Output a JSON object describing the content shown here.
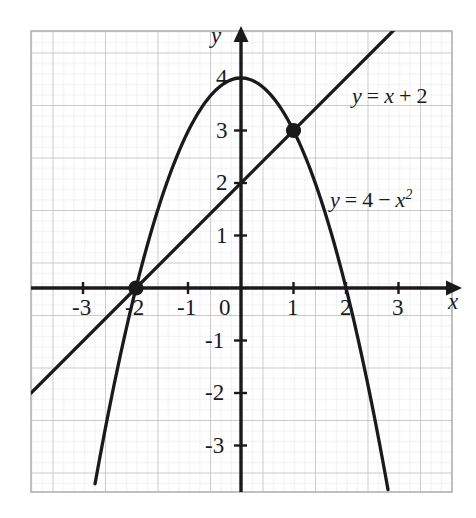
{
  "figure": {
    "kind": "cartesian-graph",
    "background": "#ffffff",
    "grid": {
      "minor_color": "#e3e3ea",
      "major_color": "#b9b9c0",
      "border_color": "#b0b0b8",
      "minor_step_units": 0.2,
      "major_step_units": 1
    },
    "axis_color": "#1a1a1a",
    "curve_color": "#1a1a1a",
    "point_color": "#1a1a1a"
  },
  "axes": {
    "x_name": "x",
    "y_name": "y",
    "x_ticks": [
      {
        "value": -3,
        "label": "-3"
      },
      {
        "value": -2,
        "label": "-2"
      },
      {
        "value": -1,
        "label": "-1"
      },
      {
        "value": 1,
        "label": "1"
      },
      {
        "value": 2,
        "label": "2"
      },
      {
        "value": 3,
        "label": "3"
      }
    ],
    "origin_label": "0",
    "y_ticks": [
      {
        "value": 4,
        "label": "4"
      },
      {
        "value": 3,
        "label": "3"
      },
      {
        "value": 2,
        "label": "2"
      },
      {
        "value": 1,
        "label": "1"
      },
      {
        "value": -1,
        "label": "-1"
      },
      {
        "value": -2,
        "label": "-2"
      },
      {
        "value": -3,
        "label": "-3"
      }
    ]
  },
  "labels": {
    "line_eq_y": "y",
    "line_eq_eq": "=",
    "line_eq_rhs_var": "x",
    "line_eq_plus": "+",
    "line_eq_const": "2",
    "parab_eq_y": "y",
    "parab_eq_eq": "=",
    "parab_eq_four": "4",
    "parab_eq_minus": "−",
    "parab_eq_var": "x",
    "parab_eq_exp": "2"
  },
  "chart_data": {
    "type": "line",
    "title": "",
    "xlabel": "x",
    "ylabel": "y",
    "xlim": [
      -4,
      4
    ],
    "ylim": [
      -3.9,
      4.9
    ],
    "grid": true,
    "legend": "inline-annotations",
    "series": [
      {
        "name": "y = x + 2",
        "equation": "y = x + 2",
        "kind": "straight-line",
        "slope": 1,
        "intercept": 2,
        "x_range": [
          -4,
          3.03
        ],
        "points": [
          {
            "x": -4,
            "y": -2
          },
          {
            "x": -2,
            "y": 0
          },
          {
            "x": 0,
            "y": 2
          },
          {
            "x": 1,
            "y": 3
          },
          {
            "x": 3.03,
            "y": 5.03
          }
        ]
      },
      {
        "name": "y = 4 - x^2",
        "equation": "y = 4 − x²",
        "kind": "parabola",
        "a": -1,
        "b": 0,
        "c": 4,
        "vertex": {
          "x": 0,
          "y": 4
        },
        "roots": [
          -2,
          2
        ],
        "x_range": [
          -2.78,
          2.8
        ],
        "points": [
          {
            "x": -2.78,
            "y": -3.73
          },
          {
            "x": -2,
            "y": 0
          },
          {
            "x": -1,
            "y": 3
          },
          {
            "x": 0,
            "y": 4
          },
          {
            "x": 1,
            "y": 3
          },
          {
            "x": 2,
            "y": 0
          },
          {
            "x": 2.8,
            "y": -3.84
          }
        ]
      }
    ],
    "annotations": [
      {
        "text": "y = x + 2",
        "x": 2.2,
        "y": 4.0
      },
      {
        "text": "y = 4 − x²",
        "x": 2.05,
        "y": 1.95
      }
    ],
    "marked_points": [
      {
        "x": -2,
        "y": 0,
        "label": "intersection-left"
      },
      {
        "x": 1,
        "y": 3,
        "label": "intersection-right"
      }
    ]
  }
}
